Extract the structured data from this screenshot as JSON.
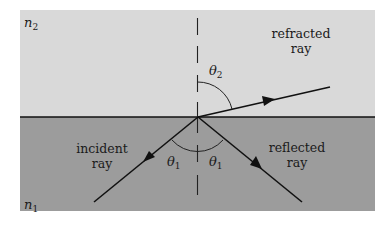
{
  "diagram": {
    "colors": {
      "upper_medium": "#d9d9d9",
      "lower_medium": "#9c9c9c",
      "lines": "#111111",
      "background": "#ffffff"
    },
    "media": {
      "upper": {
        "symbol": "n",
        "subscript": "2"
      },
      "lower": {
        "symbol": "n",
        "subscript": "1"
      }
    },
    "rays": {
      "incident": {
        "line1": "incident",
        "line2": "ray"
      },
      "refracted": {
        "line1": "refracted",
        "line2": "ray"
      },
      "reflected": {
        "line1": "reflected",
        "line2": "ray"
      }
    },
    "angles": {
      "theta2": {
        "symbol": "θ",
        "subscript": "2"
      },
      "theta1_left": {
        "symbol": "θ",
        "subscript": "1"
      },
      "theta1_right": {
        "symbol": "θ",
        "subscript": "1"
      }
    },
    "normal": {
      "style": "dashed"
    }
  }
}
